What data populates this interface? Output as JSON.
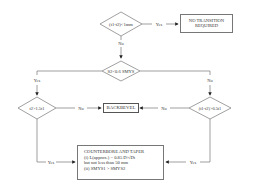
{
  "diagram": {
    "nodes": {
      "d1": {
        "label": "(t1-t2)<1mm",
        "type": "decision"
      },
      "no_transition": {
        "label_line1": "NO TRANSITION",
        "label_line2": "REQUIRED",
        "type": "terminal"
      },
      "d2": {
        "label": "S2<0.6 SMYS",
        "type": "decision"
      },
      "d3": {
        "label": "t2>1.5t1",
        "type": "decision"
      },
      "d4": {
        "label": "(t1-t2)>0.5t1",
        "type": "decision"
      },
      "backbevel": {
        "label": "BACKBEVEL",
        "type": "process"
      },
      "counterbore": {
        "type": "process",
        "lines": [
          "COUNTERBORE AND TAPER",
          "(i) L(approx.) = 0.85 D/√Dt",
          "but not less than 50 mm",
          "(ii) SMYS1 > SMYS2"
        ]
      }
    },
    "edge_labels": {
      "d1_yes": "Yes",
      "d1_no": "No",
      "d2_yes": "Yes",
      "d2_no": "No",
      "d3_no": "No",
      "d3_yes": "Yes",
      "d4_no": "No",
      "d4_yes": "Yes"
    }
  }
}
